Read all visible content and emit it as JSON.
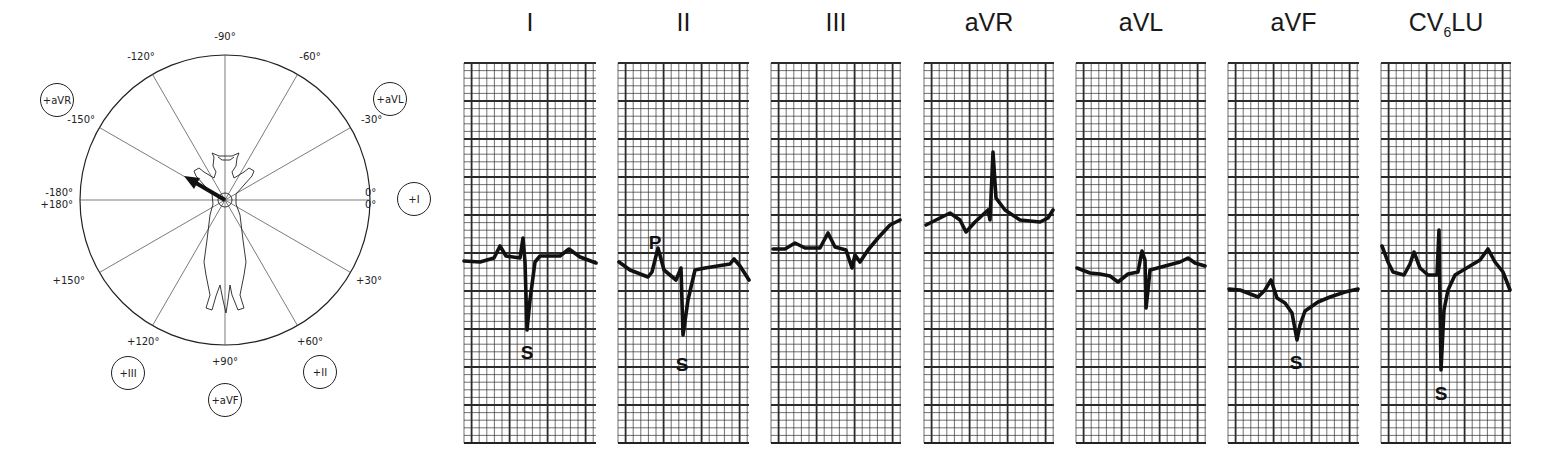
{
  "hexaxial": {
    "angle_labels": [
      {
        "angle": -90,
        "text": "-90°"
      },
      {
        "angle": -60,
        "text": "-60°"
      },
      {
        "angle": -30,
        "text": "-30°"
      },
      {
        "angle": 0,
        "text": "0°"
      },
      {
        "angle": 0,
        "text": "0°"
      },
      {
        "angle": 30,
        "text": "+30°"
      },
      {
        "angle": 60,
        "text": "+60°"
      },
      {
        "angle": 90,
        "text": "+90°"
      },
      {
        "angle": 120,
        "text": "+120°"
      },
      {
        "angle": 150,
        "text": "+150°"
      },
      {
        "angle": 180,
        "text": "+180°"
      },
      {
        "angle": -180,
        "text": "-180°"
      },
      {
        "angle": -150,
        "text": "-150°"
      },
      {
        "angle": -120,
        "text": "-120°"
      }
    ],
    "lead_badges": [
      {
        "lead": "aVR",
        "text": "+aVR"
      },
      {
        "lead": "aVL",
        "text": "+aVL"
      },
      {
        "lead": "I",
        "text": "+I"
      },
      {
        "lead": "II",
        "text": "+II"
      },
      {
        "lead": "aVF",
        "text": "+aVF"
      },
      {
        "lead": "III",
        "text": "+III"
      }
    ],
    "mean_axis_deg": -150,
    "subject": "cat"
  },
  "leads": [
    {
      "name": "I",
      "title": "I",
      "markers": [
        {
          "text": "S"
        }
      ]
    },
    {
      "name": "II",
      "title": "II",
      "markers": [
        {
          "text": "P"
        },
        {
          "text": "S"
        }
      ]
    },
    {
      "name": "III",
      "title": "III",
      "markers": []
    },
    {
      "name": "aVR",
      "title": "aVR",
      "markers": []
    },
    {
      "name": "aVL",
      "title": "aVL",
      "markers": []
    },
    {
      "name": "aVF",
      "title": "aVF",
      "markers": [
        {
          "text": "S"
        }
      ]
    },
    {
      "name": "CV6LU",
      "title_main": "CV",
      "title_sub": "6",
      "title_tail": "LU",
      "markers": [
        {
          "text": "S"
        }
      ]
    }
  ],
  "colors": {
    "ink": "#111111",
    "grid": "#2b2b2b",
    "paper": "#ffffff"
  }
}
